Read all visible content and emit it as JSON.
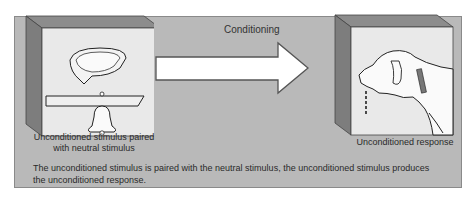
{
  "diagram": {
    "title": "Conditioning",
    "left_caption_line1": "Unconditioned stimulus paired",
    "left_caption_line2": "with neutral stimulus",
    "right_caption": "Unconditioned response",
    "description": "The unconditioned stimulus is paired with the neutral stimulus, the unconditioned stimulus produces the unconditioned response.",
    "left_panel_icons": [
      "food-bowl-icon",
      "bell-icon"
    ],
    "right_panel_icons": [
      "salivating-dog-icon"
    ],
    "arrow_icon": "right-arrow-icon"
  }
}
